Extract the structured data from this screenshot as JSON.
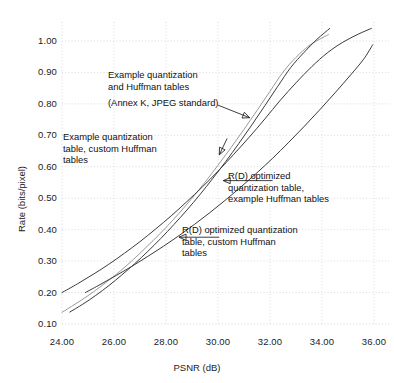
{
  "chart_data": {
    "type": "line",
    "title": "",
    "xlabel": "PSNR (dB)",
    "ylabel": "Rate (bits/pixel)",
    "xlim": [
      23.0,
      36.6
    ],
    "ylim": [
      0.085,
      1.065
    ],
    "xticks": [
      "24.00",
      "26.00",
      "28.00",
      "30.00",
      "32.00",
      "34.00",
      "36.00"
    ],
    "xtick_values": [
      24,
      26,
      28,
      30,
      32,
      34,
      36
    ],
    "yticks": [
      "0.10",
      "0.20",
      "0.30",
      "0.40",
      "0.50",
      "0.60",
      "0.70",
      "0.80",
      "0.90",
      "1.00"
    ],
    "ytick_values": [
      0.1,
      0.2,
      0.3,
      0.4,
      0.5,
      0.6,
      0.7,
      0.8,
      0.9,
      1.0
    ],
    "grid": true,
    "grid_style": "dotted",
    "legend_position": "none-inline-annotations",
    "series": [
      {
        "name": "Example quantization and Huffman tables (Annex K, JPEG standard)",
        "color": "#9a9a9a",
        "x": [
          24.0,
          24.5,
          25.0,
          25.5,
          26.0,
          26.5,
          27.0,
          27.5,
          28.0,
          28.5,
          29.0,
          29.5,
          30.0,
          30.5,
          31.0,
          31.5,
          32.0,
          32.5,
          33.0,
          33.5,
          34.0,
          34.25
        ],
        "values": [
          0.137,
          0.163,
          0.19,
          0.22,
          0.252,
          0.287,
          0.325,
          0.365,
          0.407,
          0.452,
          0.5,
          0.551,
          0.605,
          0.661,
          0.719,
          0.779,
          0.84,
          0.901,
          0.948,
          0.985,
          1.01,
          1.02
        ]
      },
      {
        "name": "Example quantization table, custom Huffman tables",
        "color": "#3b3b3b",
        "x": [
          24.3,
          24.8,
          25.3,
          25.8,
          26.3,
          26.8,
          27.3,
          27.8,
          28.3,
          28.8,
          29.3,
          29.8,
          30.3,
          30.8,
          31.3,
          31.8,
          32.3,
          32.8,
          33.3,
          33.8,
          34.3
        ],
        "values": [
          0.138,
          0.163,
          0.191,
          0.222,
          0.256,
          0.292,
          0.331,
          0.372,
          0.416,
          0.462,
          0.511,
          0.563,
          0.617,
          0.674,
          0.733,
          0.794,
          0.856,
          0.916,
          0.963,
          1.005,
          1.04
        ]
      },
      {
        "name": "R(D) optimized quantization table, example Huffman tables",
        "color": "#3b3b3b",
        "x": [
          24.0,
          24.6,
          25.2,
          25.8,
          26.4,
          27.0,
          27.6,
          28.2,
          28.8,
          29.4,
          30.0,
          30.6,
          31.2,
          31.8,
          32.4,
          33.0,
          33.6,
          34.2,
          34.8,
          35.4,
          35.9
        ],
        "values": [
          0.2,
          0.228,
          0.258,
          0.29,
          0.325,
          0.362,
          0.402,
          0.444,
          0.489,
          0.536,
          0.586,
          0.639,
          0.694,
          0.752,
          0.812,
          0.867,
          0.918,
          0.962,
          0.996,
          1.022,
          1.04
        ]
      },
      {
        "name": "R(D) optimized quantization table, custom Huffman tables",
        "color": "#3b3b3b",
        "x": [
          24.9,
          25.5,
          26.1,
          26.7,
          27.3,
          27.9,
          28.5,
          29.1,
          29.7,
          30.3,
          30.9,
          31.5,
          32.1,
          32.7,
          33.3,
          33.9,
          34.5,
          35.1,
          35.6,
          35.95
        ],
        "values": [
          0.2,
          0.227,
          0.255,
          0.284,
          0.315,
          0.347,
          0.381,
          0.417,
          0.455,
          0.495,
          0.537,
          0.581,
          0.627,
          0.676,
          0.727,
          0.78,
          0.835,
          0.892,
          0.942,
          0.988
        ]
      }
    ],
    "annotations": [
      {
        "id": "annex-k",
        "lines": [
          "Example quantization",
          "and Huffman tables",
          "",
          "(Annex K, JPEG standard)"
        ],
        "arrow": {
          "from_x": 30.0,
          "from_y": 0.796,
          "to_x": 31.22,
          "to_y": 0.756,
          "head": "right"
        }
      },
      {
        "id": "example-quant-custom-huffman",
        "lines": [
          "Example quantization",
          "table, custom Huffman",
          "tables"
        ],
        "arrow": {
          "from_x": 30.35,
          "from_y": 0.69,
          "to_x": 30.05,
          "to_y": 0.638,
          "head": "down-left"
        }
      },
      {
        "id": "rd-opt-example-huffman",
        "lines": [
          "R(D) optimized",
          "quantization table,",
          "example Huffman tables"
        ],
        "arrow": {
          "from_x": 32.1,
          "from_y": 0.556,
          "to_x": 30.2,
          "to_y": 0.556,
          "head": "left"
        }
      },
      {
        "id": "rd-opt-custom-huffman",
        "lines": [
          "R(D) optimized quantization",
          "table, custom Huffman",
          "tables"
        ],
        "arrow": {
          "from_x": 30.05,
          "from_y": 0.376,
          "to_x": 28.5,
          "to_y": 0.376,
          "head": "left"
        }
      }
    ]
  },
  "style": {
    "curve_gray": "#9a9a9a",
    "curve_dark": "#3b3b3b",
    "grid_color": "#c9c9c9",
    "text_color": "#1c1c1c",
    "background": "#ffffff"
  }
}
